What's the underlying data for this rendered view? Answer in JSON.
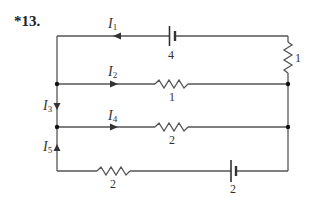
{
  "problem_number": "*13.",
  "colors": {
    "wire": "#555555",
    "node": "#111111",
    "text": "#333333"
  },
  "currents": [
    {
      "name": "I",
      "sub": "1"
    },
    {
      "name": "I",
      "sub": "2"
    },
    {
      "name": "I",
      "sub": "3"
    },
    {
      "name": "I",
      "sub": "4"
    },
    {
      "name": "I",
      "sub": "5"
    }
  ],
  "components": {
    "battery_top": {
      "type": "battery",
      "value": "4"
    },
    "resistor_right": {
      "type": "resistor",
      "value": "1"
    },
    "resistor_branch2": {
      "type": "resistor",
      "value": "1"
    },
    "resistor_branch4": {
      "type": "resistor",
      "value": "2"
    },
    "resistor_bottom": {
      "type": "resistor",
      "value": "2"
    },
    "battery_bottom": {
      "type": "battery",
      "value": "2"
    }
  }
}
